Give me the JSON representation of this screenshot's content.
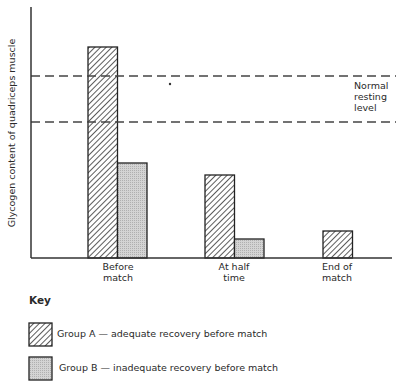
{
  "chart_data": {
    "type": "bar",
    "title": "",
    "xlabel": "",
    "ylabel": "Glycogen content of quadriceps muscle",
    "categories": [
      "Before match",
      "At half time",
      "End of match"
    ],
    "category_lines": [
      [
        "Before",
        "match"
      ],
      [
        "At half",
        "time"
      ],
      [
        "End of",
        "match"
      ]
    ],
    "series": [
      {
        "name": "Group A — adequate recovery before match",
        "pattern": "diagonal-hatch",
        "values": [
          211,
          83,
          27
        ]
      },
      {
        "name": "Group B — inadequate recovery before match",
        "pattern": "stipple-grey",
        "values": [
          95,
          19,
          0
        ]
      }
    ],
    "units": "arbitrary (no numeric axis ticks shown)",
    "ylim": [
      0,
      250
    ],
    "grid": false,
    "reference_band": {
      "label_lines": [
        "Normal",
        "resting",
        "level"
      ],
      "lower": 136,
      "upper": 182,
      "style": "dashed"
    },
    "legend": {
      "position": "bottom",
      "title": "Key"
    }
  },
  "key": {
    "title": "Key",
    "items": [
      {
        "label": "Group A — adequate recovery before match"
      },
      {
        "label": "Group B — inadequate recovery before match"
      }
    ]
  }
}
